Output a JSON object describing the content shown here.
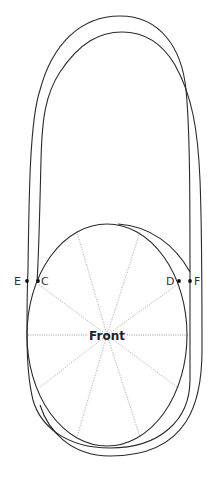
{
  "diagram": {
    "center_label": "Front",
    "points": [
      {
        "id": "E",
        "label": "E"
      },
      {
        "id": "C",
        "label": "C"
      },
      {
        "id": "D",
        "label": "D"
      },
      {
        "id": "F",
        "label": "F"
      }
    ],
    "colors": {
      "outline": "#2a2a2a",
      "guide": "#9a9a9a",
      "background": "#ffffff"
    }
  }
}
